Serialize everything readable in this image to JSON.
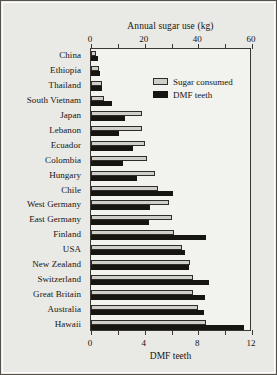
{
  "chart_data": {
    "type": "bar",
    "orientation": "horizontal",
    "title": "",
    "top_axis": {
      "label": "Annual sugar use (kg)",
      "ticks": [
        0,
        20,
        40,
        60
      ],
      "minor_ticks": [
        10,
        30,
        50
      ],
      "range": [
        0,
        60
      ]
    },
    "bottom_axis": {
      "label": "DMF teeth",
      "ticks": [
        0,
        4,
        8,
        12
      ],
      "minor_ticks": [
        2,
        6,
        10
      ],
      "range": [
        0,
        12
      ]
    },
    "grid": false,
    "legend": {
      "position": "top-right-inside",
      "entries": [
        {
          "name": "Sugar consumed",
          "color": "#cfcfc9",
          "axis": "top"
        },
        {
          "name": "DMF teeth",
          "color": "#17150f",
          "axis": "bottom"
        }
      ]
    },
    "categories": [
      "China",
      "Ethiopia",
      "Thailand",
      "South Vietnam",
      "Japan",
      "Lebanon",
      "Ecuador",
      "Colombia",
      "Hungary",
      "Chile",
      "West Germany",
      "East Germany",
      "Finland",
      "USA",
      "New Zealand",
      "Switzerland",
      "Great Britain",
      "Australia",
      "Hawaii"
    ],
    "series": [
      {
        "name": "Sugar consumed",
        "unit": "kg",
        "axis": "top",
        "values": [
          2,
          3,
          4,
          5,
          19,
          19,
          20,
          21,
          24,
          25,
          29,
          30,
          31,
          34,
          37,
          38,
          38,
          40,
          43
        ]
      },
      {
        "name": "DMF teeth",
        "unit": "teeth",
        "axis": "bottom",
        "values": [
          0.5,
          0.7,
          0.8,
          1.6,
          2.5,
          2.1,
          3.1,
          2.4,
          3.4,
          6.1,
          4.4,
          4.3,
          8.6,
          7.0,
          7.3,
          8.8,
          8.5,
          8.4,
          11.4
        ]
      }
    ]
  }
}
